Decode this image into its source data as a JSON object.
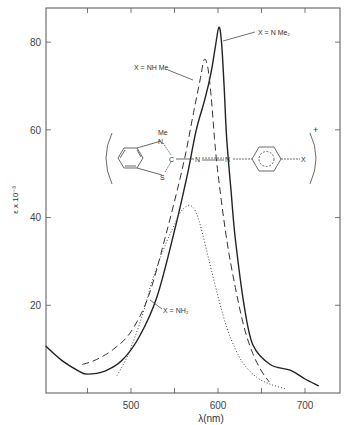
{
  "chart_data": {
    "type": "line",
    "title": "",
    "xlabel": "λ(nm)",
    "ylabel": "ε x 10⁻³",
    "xlim": [
      400,
      740
    ],
    "ylim": [
      0,
      88
    ],
    "grid": false,
    "x_ticks": [
      500,
      600,
      700
    ],
    "x_minor_ticks": [
      450,
      550,
      650
    ],
    "y_ticks": [
      20,
      40,
      60,
      80
    ],
    "legend": "inline annotations",
    "series": [
      {
        "name": "X = NMe₂",
        "style": "solid",
        "x": [
          402,
          420,
          440,
          450,
          470,
          490,
          510,
          530,
          550,
          565,
          575,
          585,
          592,
          597,
          601,
          604,
          607,
          610,
          615,
          620,
          630,
          640,
          660,
          683,
          700,
          716
        ],
        "y": [
          10.7,
          7.5,
          5.0,
          4.3,
          5.0,
          7.5,
          13.0,
          22.0,
          37.0,
          50.0,
          60.0,
          67.0,
          73.0,
          79.0,
          83.4,
          80.0,
          70.0,
          58.0,
          46.0,
          35.0,
          20.0,
          11.0,
          6.5,
          5.2,
          3.2,
          1.6
        ]
      },
      {
        "name": "X = NHMe",
        "style": "dashed",
        "x": [
          444,
          460,
          480,
          500,
          520,
          540,
          560,
          572,
          580,
          584,
          588,
          592,
          596,
          600,
          610,
          620,
          630,
          640,
          650,
          659
        ],
        "y": [
          6.5,
          7.6,
          10.0,
          14.0,
          22.0,
          36.0,
          52.0,
          64.0,
          72.0,
          76.0,
          74.5,
          68.0,
          58.0,
          50.0,
          35.0,
          24.0,
          15.0,
          9.0,
          5.0,
          2.5
        ]
      },
      {
        "name": "X = NH₂",
        "style": "dotted",
        "x": [
          484,
          495,
          505,
          515,
          525,
          540,
          555,
          562,
          568,
          574,
          580,
          590,
          600,
          610,
          620,
          630,
          645,
          660,
          677
        ],
        "y": [
          4.0,
          8.0,
          13.0,
          19.0,
          26.0,
          34.0,
          40.5,
          42.3,
          42.8,
          41.5,
          38.0,
          30.0,
          22.0,
          15.0,
          10.0,
          6.5,
          3.5,
          2.0,
          1.0
        ]
      }
    ],
    "annotations": [
      {
        "text": "X = N Me₂",
        "near_series": "X = NMe₂"
      },
      {
        "text": "X = NH Me",
        "near_series": "X = NHMe"
      },
      {
        "text": "X = NH₂",
        "near_series": "X = NH₂"
      }
    ],
    "inset_structure": {
      "description": "benzothiazolium azo dye cation",
      "labels": [
        "Me",
        "N",
        "C",
        "S",
        "N",
        "N",
        "X",
        "+"
      ]
    }
  },
  "labels": {
    "x_axis_title": "λ(nm)",
    "y_axis_title": "ε x 10⁻³",
    "tick_500": "500",
    "tick_600": "600",
    "tick_700": "700",
    "tick_20": "20",
    "tick_40": "40",
    "tick_60": "60",
    "tick_80": "80",
    "anno_nme2": "X = N Me₂",
    "anno_nhme": "X = NH Me",
    "anno_nh2": "X = NH₂",
    "struct_me": "Me",
    "struct_n1": "N",
    "struct_c": "C",
    "struct_s": "S",
    "struct_n2": "N",
    "struct_n3": "N",
    "struct_x": "X",
    "struct_plus": "+"
  }
}
